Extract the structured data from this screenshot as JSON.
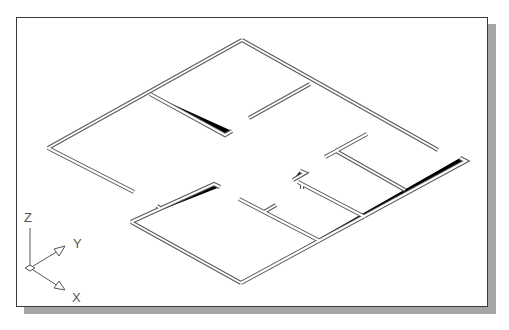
{
  "drawing": {
    "type": "isometric-floor-plan",
    "view": "SE Isometric",
    "wall_color": "#5a5a5a",
    "background": "#ffffff",
    "shadow_color": "#a6a6a6"
  },
  "ucs_icon": {
    "labels": {
      "z": "Z",
      "y": "Y",
      "x": "X"
    }
  }
}
